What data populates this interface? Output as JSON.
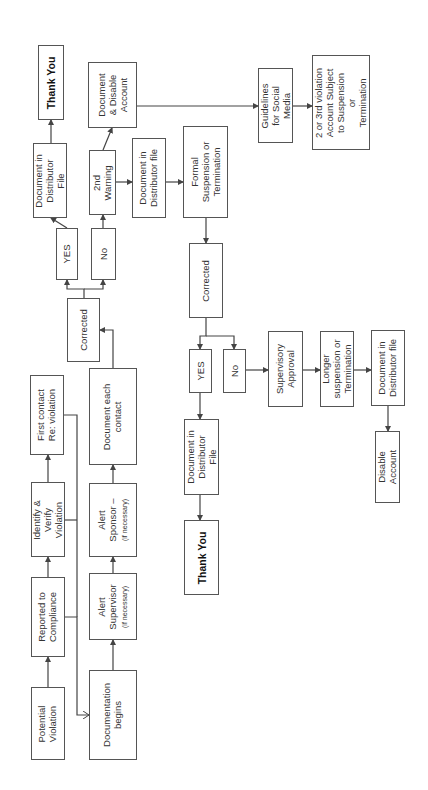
{
  "diagram": {
    "orientation": "rotated-90-ccw",
    "nodes": [
      {
        "id": "potential-violation",
        "label": "Potential\nViolation",
        "x": 31,
        "y": 687,
        "w": 34,
        "h": 73
      },
      {
        "id": "reported-to-compliance",
        "label": "Reported to\nCompliance",
        "x": 31,
        "y": 577,
        "w": 34,
        "h": 80
      },
      {
        "id": "identify-verify-violation",
        "label": "Identify &\nVerify\nViolation",
        "x": 31,
        "y": 482,
        "w": 34,
        "h": 75
      },
      {
        "id": "first-contact",
        "label": "First contact\nRe: violation",
        "x": 30,
        "y": 375,
        "w": 34,
        "h": 80
      },
      {
        "id": "documentation-begins",
        "label": "Documentation\nbegins",
        "x": 89,
        "y": 670,
        "w": 48,
        "h": 90
      },
      {
        "id": "alert-supervisor",
        "label": "Alert\nSupervisor",
        "note": "(if necessary)",
        "x": 89,
        "y": 573,
        "w": 48,
        "h": 67
      },
      {
        "id": "alert-sponsor",
        "label": "Alert\nSponsor –",
        "note": "(if necessary)",
        "x": 89,
        "y": 483,
        "w": 48,
        "h": 74
      },
      {
        "id": "document-each-contact",
        "label": "Document each\ncontact",
        "x": 89,
        "y": 368,
        "w": 48,
        "h": 97
      },
      {
        "id": "corrected-1",
        "label": "Corrected",
        "x": 67,
        "y": 298,
        "w": 33,
        "h": 64
      },
      {
        "id": "yes-1",
        "label": "YES",
        "x": 56,
        "y": 228,
        "w": 22,
        "h": 52
      },
      {
        "id": "no-1",
        "label": "No",
        "x": 91,
        "y": 228,
        "w": 25,
        "h": 52
      },
      {
        "id": "document-in-distributor-file-1",
        "label": "Document in\nDistributor\nFile",
        "x": 33,
        "y": 143,
        "w": 34,
        "h": 75
      },
      {
        "id": "thank-you-1",
        "label": "Thank You",
        "bold": true,
        "x": 38,
        "y": 45,
        "w": 26,
        "h": 75
      },
      {
        "id": "second-warning",
        "label": "2nd\nWarning",
        "x": 89,
        "y": 150,
        "w": 27,
        "h": 65
      },
      {
        "id": "document-disable-account",
        "label": "Document\n& Disable\nAccount",
        "x": 88,
        "y": 62,
        "w": 49,
        "h": 66
      },
      {
        "id": "document-in-distributor-file-2",
        "label": "Document in\nDistributor file",
        "x": 132,
        "y": 138,
        "w": 34,
        "h": 80
      },
      {
        "id": "formal-suspension",
        "label": "Formal\nSuspension or\nTermination",
        "x": 183,
        "y": 126,
        "w": 45,
        "h": 92
      },
      {
        "id": "guidelines-social-media",
        "label": "Guidelines\nfor Social\nMedia",
        "x": 258,
        "y": 68,
        "w": 35,
        "h": 75
      },
      {
        "id": "second-third-violation",
        "label": "2 or 3rd violation\nAccount Subject\nto Suspension\nor\nTermination",
        "x": 312,
        "y": 55,
        "w": 58,
        "h": 95
      },
      {
        "id": "corrected-2",
        "label": "Corrected",
        "x": 189,
        "y": 243,
        "w": 34,
        "h": 75
      },
      {
        "id": "yes-2",
        "label": "YES",
        "x": 189,
        "y": 349,
        "w": 23,
        "h": 44
      },
      {
        "id": "no-2",
        "label": "No",
        "x": 223,
        "y": 349,
        "w": 23,
        "h": 44
      },
      {
        "id": "document-in-distributor-file-3",
        "label": "Document in\nDistributor\nFile",
        "x": 184,
        "y": 419,
        "w": 35,
        "h": 76
      },
      {
        "id": "thank-you-2",
        "label": "Thank You",
        "bold": true,
        "x": 184,
        "y": 520,
        "w": 35,
        "h": 75
      },
      {
        "id": "supervisory-approval",
        "label": "Supervisory\nApproval",
        "x": 268,
        "y": 331,
        "w": 35,
        "h": 76
      },
      {
        "id": "longer-suspension",
        "label": "Longer\nsuspension or\nTermination",
        "x": 320,
        "y": 331,
        "w": 34,
        "h": 76
      },
      {
        "id": "document-in-distributor-file-4",
        "label": "Document in\nDistributor file",
        "x": 371,
        "y": 330,
        "w": 34,
        "h": 76
      },
      {
        "id": "disable-account",
        "label": "Disable\nAccount",
        "x": 375,
        "y": 431,
        "w": 25,
        "h": 72
      }
    ],
    "edges": [
      {
        "from": "potential-violation",
        "to": "reported-to-compliance",
        "points": [
          [
            48,
            687
          ],
          [
            48,
            657
          ]
        ]
      },
      {
        "from": "reported-to-compliance",
        "to": "identify-verify-violation",
        "points": [
          [
            48,
            577
          ],
          [
            48,
            557
          ]
        ]
      },
      {
        "from": "identify-verify-violation",
        "to": "first-contact",
        "points": [
          [
            48,
            482
          ],
          [
            48,
            455
          ]
        ]
      },
      {
        "from": "reported-to-compliance",
        "to": "documentation-begins",
        "points": [
          [
            65,
            617
          ],
          [
            77,
            617
          ],
          [
            77,
            715
          ],
          [
            89,
            715
          ]
        ],
        "open_head": true
      },
      {
        "from": "first-contact",
        "to": "documentation-begins",
        "points": [
          [
            64,
            415
          ],
          [
            77,
            415
          ],
          [
            77,
            617
          ]
        ],
        "no_head": true
      },
      {
        "from": "identify-verify-violation",
        "to": "documentation-begins",
        "points": [
          [
            65,
            520
          ],
          [
            77,
            520
          ]
        ],
        "no_head": true
      },
      {
        "from": "documentation-begins",
        "to": "alert-supervisor",
        "points": [
          [
            113,
            670
          ],
          [
            113,
            640
          ]
        ]
      },
      {
        "from": "alert-supervisor",
        "to": "alert-sponsor",
        "points": [
          [
            113,
            573
          ],
          [
            113,
            557
          ]
        ]
      },
      {
        "from": "alert-sponsor",
        "to": "document-each-contact",
        "points": [
          [
            113,
            483
          ],
          [
            113,
            465
          ]
        ]
      },
      {
        "from": "document-each-contact",
        "to": "corrected-1",
        "points": [
          [
            113,
            368
          ],
          [
            113,
            330
          ],
          [
            100,
            330
          ]
        ]
      },
      {
        "from": "corrected-1",
        "to": "yes-1",
        "points": [
          [
            84,
            298
          ],
          [
            84,
            289
          ],
          [
            67,
            289
          ],
          [
            67,
            280
          ]
        ]
      },
      {
        "from": "corrected-1",
        "to": "no-1",
        "points": [
          [
            84,
            289
          ],
          [
            103,
            289
          ],
          [
            103,
            280
          ]
        ]
      },
      {
        "from": "yes-1",
        "to": "document-in-distributor-file-1",
        "points": [
          [
            67,
            228
          ],
          [
            51,
            218
          ]
        ]
      },
      {
        "from": "document-in-distributor-file-1",
        "to": "thank-you-1",
        "points": [
          [
            51,
            143
          ],
          [
            51,
            120
          ]
        ]
      },
      {
        "from": "no-1",
        "to": "second-warning",
        "points": [
          [
            103,
            228
          ],
          [
            103,
            215
          ]
        ]
      },
      {
        "from": "second-warning",
        "to": "document-disable-account",
        "points": [
          [
            103,
            150
          ],
          [
            112,
            128
          ]
        ]
      },
      {
        "from": "second-warning",
        "to": "document-in-distributor-file-2",
        "points": [
          [
            116,
            182
          ],
          [
            132,
            182
          ]
        ]
      },
      {
        "from": "document-in-distributor-file-2",
        "to": "formal-suspension",
        "points": [
          [
            166,
            182
          ],
          [
            183,
            182
          ]
        ]
      },
      {
        "from": "document-disable-account",
        "to": "guidelines-social-media",
        "points": [
          [
            137,
            106
          ],
          [
            258,
            106
          ]
        ]
      },
      {
        "from": "guidelines-social-media",
        "to": "second-third-violation",
        "points": [
          [
            293,
            106
          ],
          [
            312,
            106
          ]
        ]
      },
      {
        "from": "formal-suspension",
        "to": "corrected-2",
        "points": [
          [
            206,
            218
          ],
          [
            206,
            243
          ]
        ]
      },
      {
        "from": "corrected-2",
        "to": "yes-2",
        "points": [
          [
            206,
            318
          ],
          [
            206,
            336
          ],
          [
            200,
            336
          ],
          [
            200,
            349
          ]
        ]
      },
      {
        "from": "corrected-2",
        "to": "no-2",
        "points": [
          [
            206,
            336
          ],
          [
            234,
            336
          ],
          [
            234,
            349
          ]
        ]
      },
      {
        "from": "yes-2",
        "to": "document-in-distributor-file-3",
        "points": [
          [
            200,
            393
          ],
          [
            200,
            419
          ]
        ]
      },
      {
        "from": "document-in-distributor-file-3",
        "to": "thank-you-2",
        "points": [
          [
            200,
            495
          ],
          [
            200,
            520
          ]
        ]
      },
      {
        "from": "no-2",
        "to": "supervisory-approval",
        "points": [
          [
            246,
            370
          ],
          [
            268,
            370
          ]
        ]
      },
      {
        "from": "supervisory-approval",
        "to": "longer-suspension",
        "points": [
          [
            303,
            370
          ],
          [
            320,
            370
          ]
        ]
      },
      {
        "from": "longer-suspension",
        "to": "document-in-distributor-file-4",
        "points": [
          [
            354,
            370
          ],
          [
            371,
            370
          ]
        ]
      },
      {
        "from": "document-in-distributor-file-4",
        "to": "disable-account",
        "points": [
          [
            388,
            406
          ],
          [
            388,
            431
          ]
        ]
      }
    ]
  },
  "colors": {
    "line": "#444444",
    "border": "#555555",
    "text": "#333333",
    "background": "#ffffff"
  }
}
